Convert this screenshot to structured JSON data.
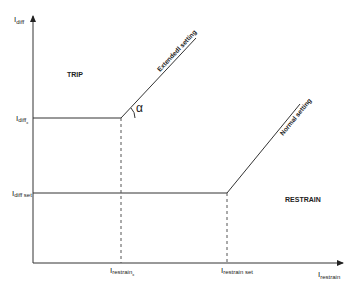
{
  "diagram": {
    "type": "differential-protection-characteristic",
    "axes": {
      "y_label": {
        "main": "I",
        "sub": "diff"
      },
      "x_label": {
        "main": "I",
        "sub": "restrain"
      }
    },
    "y_ticks": [
      {
        "main": "I",
        "sub": "diff",
        "subsub": "x"
      },
      {
        "main": "I",
        "sub": "diff set"
      }
    ],
    "x_ticks": [
      {
        "main": "I",
        "sub": "restrain",
        "subsub": "x"
      },
      {
        "main": "I",
        "sub": "restrain set"
      }
    ],
    "regions": {
      "trip": "TRIP",
      "restrain": "RESTRAIN"
    },
    "curves": {
      "extended": "Extendedl setting",
      "normal": "Normal setting"
    },
    "angle_label": "α",
    "colors": {
      "line": "#222222",
      "guide": "#555555",
      "text": "#222222"
    }
  }
}
